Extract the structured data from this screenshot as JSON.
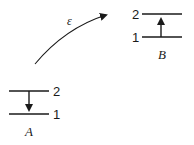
{
  "diagram": {
    "type": "energy-transfer",
    "transfer_label": "ε",
    "system_a": {
      "name": "A",
      "levels": [
        {
          "label": "2"
        },
        {
          "label": "1"
        }
      ],
      "transition": "2 → 1 (down)"
    },
    "system_b": {
      "name": "B",
      "levels": [
        {
          "label": "2"
        },
        {
          "label": "1"
        }
      ],
      "transition": "1 → 2 (up)"
    },
    "colors": {
      "stroke": "#1a1a1a",
      "background": "#ffffff"
    }
  }
}
